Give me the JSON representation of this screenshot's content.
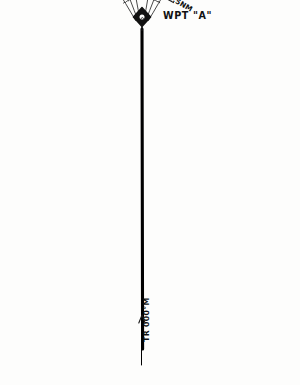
{
  "diagram": {
    "title": "WPT \"A\"",
    "type": "aviation-track-fan",
    "waypoint": {
      "label": "WPT \"A\"",
      "symbol": "waypoint-diamond",
      "x": 142,
      "y": 17
    },
    "track": {
      "label": "TR 000°M",
      "bearing": "000°M",
      "style": "bold-centerline"
    },
    "units": "NM",
    "colors": {
      "ink": "#1b1b1b",
      "paper": "#fdfdfc",
      "track": "#000000"
    },
    "range_rings": [
      {
        "label": "0.5NM",
        "value": 0.5
      },
      {
        "label": "1.0NM",
        "value": 1.0
      },
      {
        "label": "1.5NM",
        "value": 1.5
      },
      {
        "label": "2.0NM",
        "value": 2.0
      },
      {
        "label": "2.5NM",
        "value": 2.5
      },
      {
        "label": "3.0NM",
        "value": 3.0
      },
      {
        "label": "3.5NM",
        "value": 3.5
      },
      {
        "label": "4.0NM",
        "value": 4.0
      },
      {
        "label": "4.5NM",
        "value": 4.5
      },
      {
        "label": "5.0NM",
        "value": 5.0
      }
    ],
    "left_ring_labels": [
      "0.5NM",
      "1.0NM",
      "1.5NM",
      "2.0NM",
      "2.5NM",
      "3.0NM",
      "3.5NM",
      "4.0NM",
      "4.5NM",
      "5.0NM"
    ],
    "right_ring_labels": [
      "0.5NM",
      "1.0NM",
      "1.5NM",
      "2.0NM",
      "2.5NM",
      "3.0NM",
      "3.5NM",
      "4.0NM",
      "4.5NM",
      "5.0NM"
    ],
    "bearings": [
      {
        "label": "006°M",
        "value": 6,
        "side": "left"
      },
      {
        "label": "004°M",
        "value": 4,
        "side": "left"
      },
      {
        "label": "002°M",
        "value": 2,
        "side": "left"
      },
      {
        "label": "TR 000°M",
        "value": 0,
        "side": "center"
      },
      {
        "label": "358°M",
        "value": 358,
        "side": "right"
      },
      {
        "label": "356°M",
        "value": 356,
        "side": "right"
      },
      {
        "label": "354°M",
        "value": 354,
        "side": "right"
      }
    ]
  },
  "chart_data": {
    "type": "line",
    "xlabel": "Magnetic bearing",
    "ylabel": "Distance from waypoint (NM)",
    "categories": [
      "006°M",
      "004°M",
      "002°M",
      "TR 000°M",
      "358°M",
      "356°M",
      "354°M"
    ],
    "ylim": [
      0,
      5
    ],
    "grid": true,
    "legend": "none",
    "rings": [
      0.5,
      1.0,
      1.5,
      2.0,
      2.5,
      3.0,
      3.5,
      4.0,
      4.5,
      5.0
    ],
    "series": [
      {
        "name": "006°M",
        "offset_deg": 6
      },
      {
        "name": "004°M",
        "offset_deg": 4
      },
      {
        "name": "002°M",
        "offset_deg": 2
      },
      {
        "name": "TR 000°M",
        "offset_deg": 0
      },
      {
        "name": "358°M",
        "offset_deg": -2
      },
      {
        "name": "356°M",
        "offset_deg": -4
      },
      {
        "name": "354°M",
        "offset_deg": -6
      }
    ]
  }
}
